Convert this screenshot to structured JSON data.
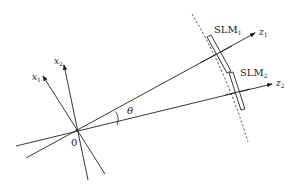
{
  "diagram": {
    "origin_label": "0",
    "angle_label": "θ",
    "axes": [
      {
        "id": "z1",
        "base": "z",
        "sub": "1"
      },
      {
        "id": "z2",
        "base": "z",
        "sub": "2"
      },
      {
        "id": "x1",
        "base": "x",
        "sub": "1"
      },
      {
        "id": "x2",
        "base": "x",
        "sub": "2"
      }
    ],
    "slms": [
      {
        "id": "SLM1",
        "base": "SLM",
        "sub": "1"
      },
      {
        "id": "SLM2",
        "base": "SLM",
        "sub": "2"
      }
    ],
    "colors": {
      "stroke": "#222222",
      "background": "#ffffff"
    }
  }
}
